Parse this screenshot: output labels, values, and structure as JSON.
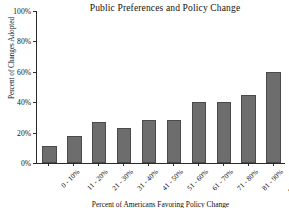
{
  "chart_data": {
    "type": "bar",
    "title": "Public Preferences and Policy Change",
    "xlabel": "Percent of Americans Favoring Policy Change",
    "ylabel": "Percent of Changes Adopted",
    "categories": [
      "0 - 10%",
      "11 - 20%",
      "21 - 30%",
      "31 - 40%",
      "41 - 50%",
      "51 - 60%",
      "61 - 70%",
      "71 - 80%",
      "81 - 90%",
      "91 - 100%"
    ],
    "values": [
      11,
      18,
      27,
      23,
      28,
      28,
      40,
      40,
      45,
      60
    ],
    "ylim": [
      0,
      100
    ],
    "yticks": [
      0,
      20,
      40,
      60,
      80,
      100
    ],
    "ytick_labels": [
      "0%",
      "20%",
      "40%",
      "60%",
      "80%",
      "100%"
    ],
    "grid": false,
    "legend": "none",
    "bar_color": "#6d6d6d",
    "bar_edge_color": "#4a4a4a",
    "axis_color": "#2b2b2b",
    "background": "#ffffff"
  }
}
